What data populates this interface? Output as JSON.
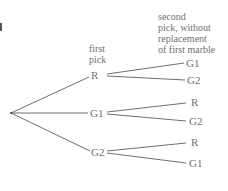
{
  "diagram": {
    "type": "probability-tree",
    "headers": {
      "first": [
        "first",
        "pick"
      ],
      "second": [
        "second",
        "pick, without",
        "replacement",
        "of first marble"
      ]
    },
    "first_pick": [
      {
        "label": "R",
        "children": [
          "G1",
          "G2"
        ]
      },
      {
        "label": "G1",
        "children": [
          "R",
          "G2"
        ]
      },
      {
        "label": "G2",
        "children": [
          "R",
          "G1"
        ]
      }
    ],
    "colors": {
      "line": "#4a4a4a",
      "text": "#707070"
    }
  }
}
